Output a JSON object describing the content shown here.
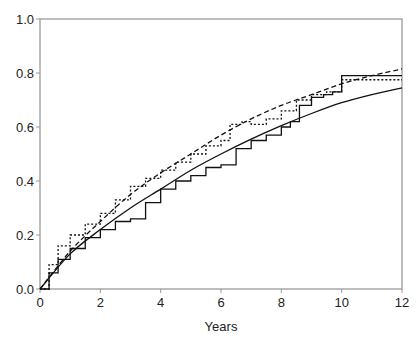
{
  "chart_data": {
    "type": "line",
    "title": "",
    "xlabel": "Years",
    "ylabel": "",
    "xlim": [
      0,
      12
    ],
    "ylim": [
      0,
      1.0
    ],
    "grid": false,
    "legend": null,
    "x_ticks": [
      "0",
      "2",
      "4",
      "6",
      "8",
      "10",
      "12"
    ],
    "y_ticks": [
      "0.0",
      "0.2",
      "0.4",
      "0.6",
      "0.8",
      "1.0"
    ],
    "series": [
      {
        "name": "observed-solid-step",
        "style": "solid",
        "step": true,
        "x": [
          0,
          0.3,
          0.6,
          1.0,
          1.5,
          2.0,
          2.5,
          3.0,
          3.5,
          4.0,
          4.5,
          5.0,
          5.5,
          6.0,
          6.5,
          7.0,
          7.5,
          8.0,
          8.3,
          8.6,
          9.0,
          9.4,
          9.7,
          10.0,
          12.0
        ],
        "values": [
          0,
          0.06,
          0.11,
          0.15,
          0.19,
          0.22,
          0.25,
          0.26,
          0.32,
          0.37,
          0.4,
          0.42,
          0.45,
          0.46,
          0.52,
          0.55,
          0.57,
          0.6,
          0.62,
          0.68,
          0.71,
          0.72,
          0.73,
          0.79,
          0.79
        ]
      },
      {
        "name": "observed-dotted-step",
        "style": "dotted",
        "step": true,
        "x": [
          0,
          0.3,
          0.6,
          1.0,
          1.5,
          2.0,
          2.5,
          3.0,
          3.5,
          4.0,
          4.5,
          5.0,
          5.5,
          6.0,
          6.3,
          6.7,
          7.0,
          7.5,
          8.0,
          8.5,
          9.0,
          9.5,
          10.0,
          12.0
        ],
        "values": [
          0,
          0.09,
          0.16,
          0.2,
          0.24,
          0.28,
          0.33,
          0.38,
          0.41,
          0.44,
          0.47,
          0.5,
          0.53,
          0.55,
          0.61,
          0.62,
          0.61,
          0.63,
          0.66,
          0.7,
          0.72,
          0.73,
          0.775,
          0.775
        ]
      },
      {
        "name": "fitted-solid-smooth",
        "style": "solid",
        "step": false,
        "x": [
          0,
          1,
          2,
          3,
          4,
          5,
          6,
          7,
          8,
          9,
          10,
          11,
          12
        ],
        "values": [
          0,
          0.13,
          0.22,
          0.3,
          0.37,
          0.44,
          0.5,
          0.555,
          0.605,
          0.65,
          0.69,
          0.72,
          0.745
        ]
      },
      {
        "name": "fitted-dashed-smooth",
        "style": "dashed",
        "step": false,
        "x": [
          0,
          1,
          2,
          3,
          4,
          5,
          6,
          7,
          8,
          9,
          10,
          11,
          12
        ],
        "values": [
          0,
          0.14,
          0.25,
          0.35,
          0.43,
          0.5,
          0.57,
          0.63,
          0.68,
          0.72,
          0.76,
          0.79,
          0.815
        ]
      }
    ]
  }
}
